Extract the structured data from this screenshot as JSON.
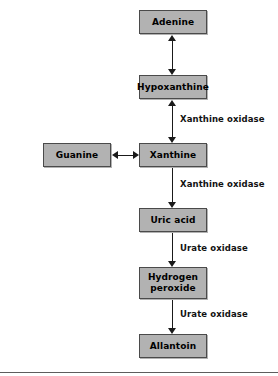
{
  "diagram": {
    "colors": {
      "node_fill": "#b2b2b2",
      "node_border": "#4a4a4a",
      "arrow": "#1a1a1a",
      "text": "#000000",
      "background": "#ffffff",
      "rule": "#5d5d5d"
    },
    "nodes": [
      {
        "id": "adenine",
        "label": "Adenine",
        "label_line2": ""
      },
      {
        "id": "hypoxanthine",
        "label": "Hypoxanthine",
        "label_line2": ""
      },
      {
        "id": "guanine",
        "label": "Guanine",
        "label_line2": ""
      },
      {
        "id": "xanthine",
        "label": "Xanthine",
        "label_line2": ""
      },
      {
        "id": "uric-acid",
        "label": "Uric acid",
        "label_line2": ""
      },
      {
        "id": "hydrogen-peroxide",
        "label": "Hydrogen",
        "label_line2": "peroxide"
      },
      {
        "id": "allantoin",
        "label": "Allantoin",
        "label_line2": ""
      }
    ],
    "edges": [
      {
        "id": "adenine-hypoxanthine",
        "from": "adenine",
        "to": "hypoxanthine",
        "direction": "both",
        "label": ""
      },
      {
        "id": "hypoxanthine-xanthine",
        "from": "hypoxanthine",
        "to": "xanthine",
        "direction": "both",
        "label": "Xanthine oxidase"
      },
      {
        "id": "guanine-xanthine",
        "from": "guanine",
        "to": "xanthine",
        "direction": "both",
        "label": ""
      },
      {
        "id": "xanthine-uric-acid",
        "from": "xanthine",
        "to": "uric-acid",
        "direction": "down",
        "label": "Xanthine oxidase"
      },
      {
        "id": "uric-acid-hydrogen-peroxide",
        "from": "uric-acid",
        "to": "hydrogen-peroxide",
        "direction": "down",
        "label": "Urate oxidase"
      },
      {
        "id": "hydrogen-peroxide-allantoin",
        "from": "hydrogen-peroxide",
        "to": "allantoin",
        "direction": "down",
        "label": "Urate oxidase"
      }
    ]
  }
}
